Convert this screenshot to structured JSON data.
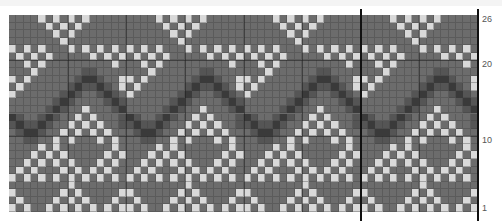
{
  "chart": {
    "columns": 64,
    "rows": 26,
    "repeat_width": 16,
    "colors": {
      "background": "#6c6c6c",
      "light": "#d9d9d9",
      "medium": "#555555",
      "dark": "#3a3a3a"
    },
    "motif_rows_top_to_bottom": [
      "....L.L.L.L.....",
      ".....L.L.L......",
      "......L.L.......",
      ".......L........",
      "L.L.L...L.L.L.L.",
      ".L.L.L.....L.L.L",
      "..L.L.........L.",
      "...L......MM....",
      "L.L......MDDM..L",
      ".L......MDMMDM.L",
      "L......MDM..MDM.",
      "......MDM....MDM",
      ".....MDM..L...MD",
      "DM..MDM..L.L...M",
      "MDMMDM..L.L.L..M",
      ".MDDM..L.L.L.L..",
      "..MM..L.L...L.L.",
      "....L.L.......L.",
      "...L.L.L.....L.L",
      "..L.L.L.L...L.L.",
      ".L.L...L.L.L.L..",
      "L.L.L.L.L.L.L.L.",
      "........L.......",
      "L......L.L.....L",
      ".L....L.L.L...L.",
      "L.L..L.L.L.L.L.L"
    ],
    "row_labels": [
      {
        "row": 26,
        "text": "26"
      },
      {
        "row": 20,
        "text": "20"
      },
      {
        "row": 10,
        "text": "10"
      },
      {
        "row": 1,
        "text": "1"
      }
    ],
    "marker_lines_at_columns": [
      48,
      64
    ]
  }
}
